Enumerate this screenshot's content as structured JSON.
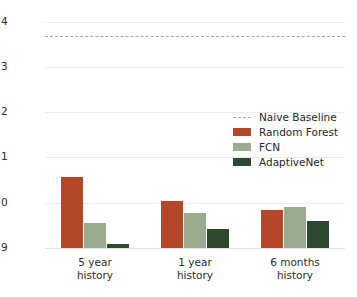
{
  "chart_data": {
    "type": "bar",
    "title": "",
    "xlabel": "",
    "ylabel": "",
    "categories": [
      "5 year\nhistory",
      "1 year\nhistory",
      "6 months\nhistory"
    ],
    "series": [
      {
        "name": "Random Forest",
        "color": "#b4462a",
        "values": [
          1.057,
          1.003,
          0.985
        ]
      },
      {
        "name": "FCN",
        "color": "#9aab90",
        "values": [
          0.955,
          0.978,
          0.99
        ]
      },
      {
        "name": "AdaptiveNet",
        "color": "#2e4a2e",
        "values": [
          0.908,
          0.942,
          0.96
        ]
      }
    ],
    "reference_lines": [
      {
        "name": "Naive Baseline",
        "value": 1.368,
        "color": "#a6a6a6",
        "style": "dashed"
      }
    ],
    "ylim": [
      0.9,
      1.421
    ],
    "yticks": [
      0.9,
      1.0,
      1.1,
      1.2,
      1.3,
      1.4
    ],
    "ytick_labels": [
      "0.9",
      "1.0",
      "1.1",
      "1.2",
      "1.3",
      "1.4"
    ],
    "grid": true,
    "grid_axis": "y",
    "legend_position": "upper right",
    "legend_entries": [
      "Naive Baseline",
      "Random Forest",
      "FCN",
      "AdaptiveNet"
    ],
    "background_color": "#ffffff",
    "grid_color": "#eaeaf0"
  },
  "legend": {
    "items": [
      {
        "label": "Naive Baseline",
        "kind": "dash"
      },
      {
        "label": "Random Forest",
        "kind": "rf"
      },
      {
        "label": "FCN",
        "kind": "fcn"
      },
      {
        "label": "AdaptiveNet",
        "kind": "anet"
      }
    ]
  }
}
